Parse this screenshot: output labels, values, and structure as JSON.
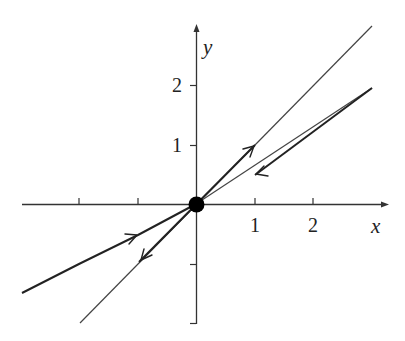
{
  "diagram": {
    "type": "phase-portrait",
    "axes": {
      "x_label": "x",
      "y_label": "y",
      "x_ticks": [
        {
          "value": -2,
          "label": ""
        },
        {
          "value": -1,
          "label": ""
        },
        {
          "value": 1,
          "label": "1"
        },
        {
          "value": 2,
          "label": "2"
        }
      ],
      "y_ticks": [
        {
          "value": -2,
          "label": ""
        },
        {
          "value": -1,
          "label": ""
        },
        {
          "value": 1,
          "label": "1"
        },
        {
          "value": 2,
          "label": "2"
        }
      ]
    },
    "equilibrium": {
      "x": 0,
      "y": 0,
      "kind": "saddle"
    },
    "lines": [
      {
        "name": "unstable-line",
        "slope": 1.0,
        "direction": "away-from-origin",
        "weight": "thin-outer / thick-inner"
      },
      {
        "name": "stable-line",
        "slope": 0.5,
        "direction": "toward-origin",
        "weight": "thick"
      }
    ],
    "colors": {
      "ink": "#222222",
      "background": "#ffffff"
    }
  }
}
